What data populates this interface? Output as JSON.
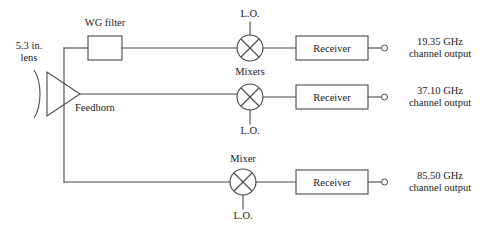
{
  "diagram": {
    "optics": {
      "lens_label_line1": "5.3 in.",
      "lens_label_line2": "lens",
      "lens_icon": "lens-arc-icon",
      "feedhorn_label": "Feedhorn",
      "feedhorn_icon": "feedhorn-triangle-icon"
    },
    "components": {
      "wg_filter_label": "WG filter",
      "receiver_label": "Receiver",
      "mixer_icon": "mixer-circle-cross-icon",
      "terminal_icon": "output-terminal-icon"
    },
    "mixer_group_label_top": "Mixers",
    "mixer_group_label_bottom": "Mixer",
    "lo_label": "L.O.",
    "channels": [
      {
        "id": "channel-1",
        "frequency": "19.35 GHz",
        "output_label": "channel output",
        "lo_label": "L.O.",
        "lo_position": "top",
        "has_wg_filter": true,
        "receiver_label": "Receiver"
      },
      {
        "id": "channel-2",
        "frequency": "37.10 GHz",
        "output_label": "channel output",
        "lo_label": "L.O.",
        "lo_position": "bottom",
        "has_wg_filter": false,
        "receiver_label": "Receiver"
      },
      {
        "id": "channel-3",
        "frequency": "85.50 GHz",
        "output_label": "channel output",
        "lo_label": "L.O.",
        "lo_position": "bottom",
        "has_wg_filter": false,
        "receiver_label": "Receiver"
      }
    ],
    "colors": {
      "line": "#4a4a4a",
      "text": "#1a1a1a",
      "background": "#ffffff"
    }
  }
}
